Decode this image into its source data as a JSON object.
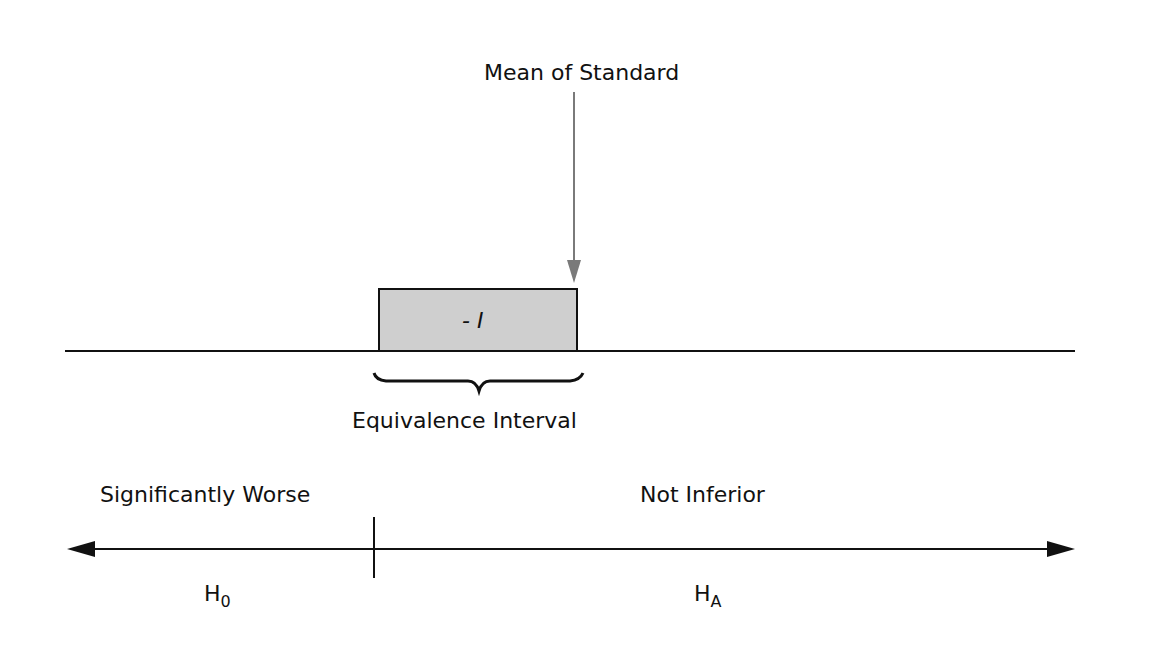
{
  "diagram": {
    "title_arrow_label": "Mean of Standard",
    "box_label": "- I",
    "brace_label": "Equivalence Interval",
    "left_region_label": "Significantly Worse",
    "right_region_label": "Not Inferior",
    "left_hypothesis": {
      "main": "H",
      "sub": "0"
    },
    "right_hypothesis": {
      "main": "H",
      "sub": "A"
    },
    "colors": {
      "line": "#111111",
      "arrow": "#7a7a7a",
      "box_fill": "#cfcfcf",
      "box_stroke": "#111111"
    }
  }
}
